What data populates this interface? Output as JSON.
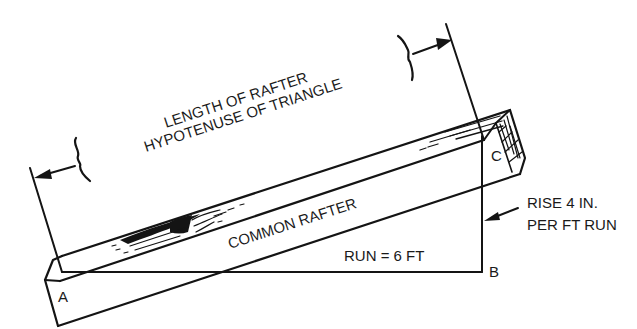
{
  "diagram": {
    "labels": {
      "length_line1": "LENGTH OF RAFTER",
      "length_line2": "HYPOTENUSE OF TRIANGLE",
      "rafter": "COMMON RAFTER",
      "run": "RUN = 6 FT",
      "rise_line1": "RISE 4 IN.",
      "rise_line2": "PER FT RUN",
      "point_a": "A",
      "point_b": "B",
      "point_c": "C"
    },
    "points": {
      "A": {
        "x": 62,
        "y": 272
      },
      "B": {
        "x": 482,
        "y": 272
      },
      "C": {
        "x": 482,
        "y": 136
      }
    },
    "values": {
      "run_ft": 6,
      "rise_in_per_ft": 4
    },
    "colors": {
      "ink": "#141414",
      "background": "#ffffff"
    }
  }
}
